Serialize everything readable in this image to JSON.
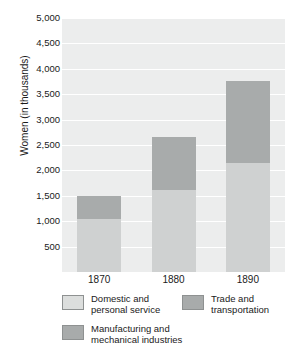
{
  "chart_data": {
    "type": "bar",
    "stacked": true,
    "title": "",
    "xlabel": "",
    "ylabel": "Women (in thousands)",
    "categories": [
      "1870",
      "1880",
      "1890"
    ],
    "series": [
      {
        "name": "Domestic and\npersonal service",
        "values": [
          1050,
          1620,
          2140
        ],
        "color": "#cfd1d1"
      },
      {
        "name": "Manufacturing and\nmechanical industries",
        "values": [
          450,
          1030,
          1630
        ],
        "color": "#a8abab"
      },
      {
        "name": "Trade and\ntransportation",
        "values": [
          0,
          0,
          0
        ],
        "color": "#a8abab"
      }
    ],
    "totals": [
      1500,
      2650,
      3770
    ],
    "ylim": [
      0,
      5000
    ],
    "yticks": [
      500,
      1000,
      1500,
      2000,
      2500,
      3000,
      3500,
      4000,
      4500,
      5000
    ],
    "ytick_labels": [
      "500",
      "1,000",
      "1,500",
      "2,000",
      "2,500",
      "3,000",
      "3,500",
      "4,000",
      "4,500",
      "5,000"
    ],
    "grid": true,
    "legend_position": "bottom",
    "plot_background": "#eceded"
  },
  "legend": {
    "items": [
      {
        "label": "Domestic and\npersonal service",
        "swatch": "#dcdedd"
      },
      {
        "label": "Trade and\ntransportation",
        "swatch": "#a8abab"
      },
      {
        "label": "Manufacturing and\nmechanical industries",
        "swatch": "#a8abab"
      }
    ]
  }
}
